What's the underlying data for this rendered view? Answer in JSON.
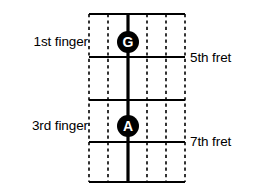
{
  "diagram": {
    "kind": "guitar-fretboard-chord-diagram",
    "title": "",
    "colors": {
      "background": "#ffffff",
      "line": "#000000",
      "marker_fill": "#000000",
      "marker_text": "#ffffff"
    },
    "fretboard": {
      "left": 89,
      "right": 185,
      "top": 14,
      "bottom": 182,
      "string_count": 6,
      "strings": [
        {
          "index": 1,
          "x": 89,
          "style": "dashed",
          "played": false
        },
        {
          "index": 2,
          "x": 108,
          "style": "dashed",
          "played": false
        },
        {
          "index": 3,
          "x": 128,
          "style": "solid",
          "played": true
        },
        {
          "index": 4,
          "x": 147,
          "style": "dashed",
          "played": false
        },
        {
          "index": 5,
          "x": 166,
          "style": "dashed",
          "played": false
        },
        {
          "index": 6,
          "x": 185,
          "style": "dashed",
          "played": false
        }
      ],
      "frets": [
        {
          "y": 14,
          "style": "solid"
        },
        {
          "y": 57,
          "style": "solid"
        },
        {
          "y": 100,
          "style": "solid"
        },
        {
          "y": 142,
          "style": "solid"
        },
        {
          "y": 182,
          "style": "solid"
        }
      ]
    },
    "markers": [
      {
        "id": "note-g",
        "label": "G",
        "cx": 128,
        "cy": 42,
        "r": 11
      },
      {
        "id": "note-a",
        "label": "A",
        "cx": 128,
        "cy": 126,
        "r": 11
      }
    ],
    "labels": {
      "finger_1": "1st finger",
      "finger_3": "3rd finger",
      "fret_5": "5th fret",
      "fret_7": "7th fret"
    }
  }
}
